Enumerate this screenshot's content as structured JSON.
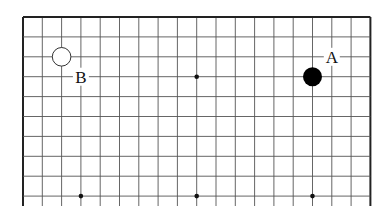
{
  "diagram": {
    "type": "go-board-fragment",
    "columns": 19,
    "rows_visible": 10,
    "edges": [
      "top",
      "left",
      "right"
    ],
    "grid_origin": {
      "x": 23,
      "y": 17
    },
    "col_step": 19.3,
    "row_step": 19.9,
    "grid_extend_bottom": 206,
    "line_color": "#555555",
    "edge_color": "#222222",
    "star_points": [
      {
        "col": 9,
        "row": 3
      },
      {
        "col": 3,
        "row": 9
      },
      {
        "col": 9,
        "row": 9
      },
      {
        "col": 15,
        "row": 9
      }
    ],
    "stones": [
      {
        "color": "white",
        "col": 2,
        "row": 2
      },
      {
        "color": "black",
        "col": 15,
        "row": 3
      }
    ],
    "labels": [
      {
        "text": "B",
        "col": 3,
        "row": 3
      },
      {
        "text": "A",
        "col": 16,
        "row": 2
      }
    ]
  }
}
